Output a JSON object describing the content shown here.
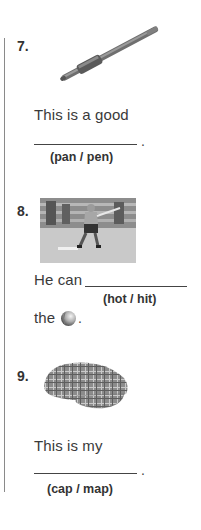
{
  "exercises": [
    {
      "number": "7.",
      "image": "pen-image",
      "sentence_before": "This is a good",
      "sentence_after": ".",
      "choices": "(pan / pen)"
    },
    {
      "number": "8.",
      "image": "baseball-batter-photo",
      "sentence_before": "He can",
      "choices": "(hot / hit)",
      "sentence_line2_before": "the",
      "inline_image": "ball-icon",
      "sentence_after": "."
    },
    {
      "number": "9.",
      "image": "flat-cap-image",
      "sentence_before": "This is my",
      "sentence_after": ".",
      "choices": "(cap / map)"
    }
  ],
  "colors": {
    "text": "#333333",
    "rule": "#8a8a8a",
    "background": "#ffffff"
  }
}
